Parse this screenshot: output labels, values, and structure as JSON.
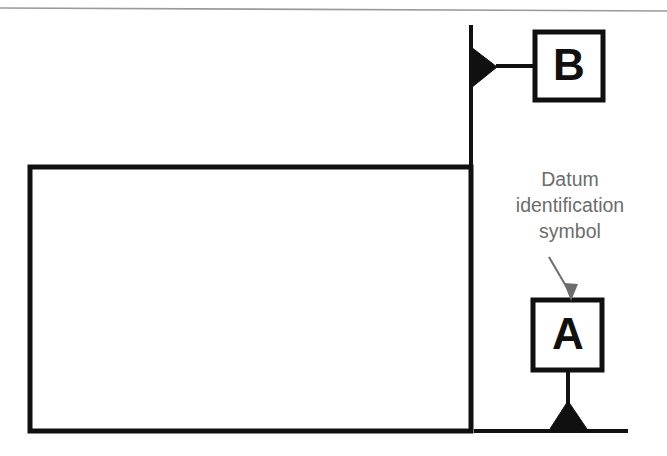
{
  "figure": {
    "kind": "gd-and-t-datum-identification-drawing",
    "background_color": "#ffffff",
    "line_color": "#101010",
    "rule_color": "#9a9a9a",
    "annotation_color": "#6c6c6c",
    "top_rule": {
      "name": "page-top-rule",
      "x1": 0,
      "y1": 8,
      "x2": 667,
      "y2": 11,
      "stroke_width": 1.6
    },
    "part_outline": {
      "name": "part-rectangle",
      "x": 30,
      "y": 167,
      "width": 441,
      "height": 264,
      "stroke_width": 5
    },
    "extension_line_vertical": {
      "name": "vertical-extension-line",
      "x1": 471,
      "y1": 25,
      "x2": 471,
      "y2": 166,
      "stroke_width": 4
    },
    "extension_line_horizontal": {
      "name": "horizontal-extension-line",
      "x1": 474,
      "y1": 431,
      "x2": 628,
      "y2": 431,
      "stroke_width": 4
    },
    "datum_b": {
      "name": "datum-feature-symbol-b",
      "letter": "B",
      "box": {
        "x": 535,
        "y": 32,
        "width": 68,
        "height": 68,
        "stroke_width": 5
      },
      "leader": {
        "x1": 497,
        "y1": 66,
        "x2": 535,
        "y2": 66,
        "stroke_width": 4
      },
      "triangle_points": "497,67 471,47 471,88",
      "orientation": "points-left-to-vertical-surface"
    },
    "datum_a": {
      "name": "datum-feature-symbol-a",
      "letter": "A",
      "box": {
        "x": 533,
        "y": 300,
        "width": 69,
        "height": 70,
        "stroke_width": 5
      },
      "leader": {
        "x1": 568,
        "y1": 370,
        "x2": 568,
        "y2": 405,
        "stroke_width": 4
      },
      "triangle_points": "568,401 548,431 589,431",
      "orientation": "points-down-to-horizontal-surface"
    },
    "callout": {
      "name": "datum-identification-callout",
      "lines": [
        "Datum",
        "identification",
        "symbol"
      ],
      "line_x": 570,
      "line_ys": [
        186,
        212,
        238
      ],
      "arrow": {
        "name": "callout-leader-arrow",
        "x1": 549,
        "y1": 257,
        "x2": 571,
        "y2": 296,
        "stroke_width": 2,
        "head_points": "571,301 564,284 578,284"
      }
    }
  }
}
